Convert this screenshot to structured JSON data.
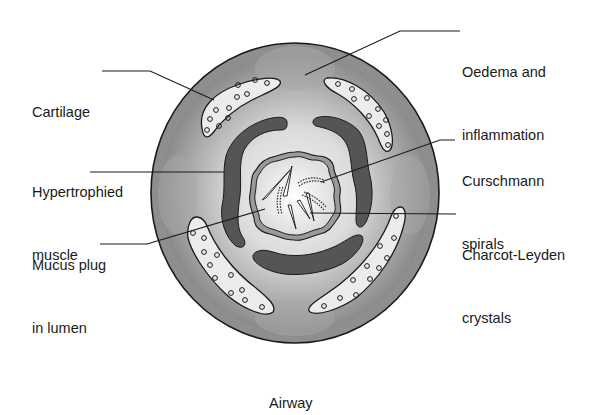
{
  "figure": {
    "caption": "Airway",
    "labels": {
      "cartilage": {
        "lines": [
          "Cartilage"
        ]
      },
      "muscle": {
        "lines": [
          "Hypertrophied",
          "muscle"
        ]
      },
      "mucus": {
        "lines": [
          "Mucus plug",
          "in lumen"
        ]
      },
      "oedema": {
        "lines": [
          "Oedema and",
          "inflammation"
        ]
      },
      "curschmann": {
        "lines": [
          "Curschmann",
          "spirals"
        ]
      },
      "charcot": {
        "lines": [
          "Charcot-Leyden",
          "crystals"
        ]
      }
    },
    "colors": {
      "outer_ring": "#8c8c8c",
      "inflamed_wall": "#b8b8b8",
      "wall_highlight": "#e6e6e6",
      "cartilage_fill": "#ececec",
      "muscle": "#555555",
      "lumen": "#f0f0f0",
      "line": "#1a1a1a"
    }
  }
}
